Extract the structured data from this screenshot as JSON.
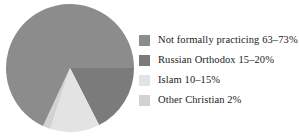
{
  "chart_data": {
    "type": "pie",
    "title": "",
    "subtitle": "",
    "xlabel": "",
    "ylabel": "",
    "legend_position": "right",
    "grid": false,
    "categories": [
      "Not formally practicing",
      "Russian Orthodox",
      "Islam",
      "Other Christian"
    ],
    "labels": [
      "Not formally practicing 63–73%",
      "Russian Orthodox 15–20%",
      "Islam 10–15%",
      "Other Christian 2%"
    ],
    "value_text": [
      "63–73%",
      "15–20%",
      "10–15%",
      "2%"
    ],
    "values": [
      68,
      17.5,
      12.5,
      2
    ],
    "ranges": [
      {
        "min": 63,
        "max": 73
      },
      {
        "min": 15,
        "max": 20
      },
      {
        "min": 10,
        "max": 15
      },
      {
        "min": 2,
        "max": 2
      }
    ],
    "colors": [
      "#8c8c8c",
      "#7b7b7b",
      "#e3e3e3",
      "#d2d2d2"
    ],
    "start_angle_deg": 0,
    "direction": "clockwise",
    "units": "percent"
  },
  "legend": {
    "items": [
      {
        "label": "Not formally practicing 63–73%",
        "swatch": "#8c8c8c",
        "swatch_name": "swatch-not-formally-practicing"
      },
      {
        "label": "Russian Orthodox 15–20%",
        "swatch": "#7b7b7b",
        "swatch_name": "swatch-russian-orthodox"
      },
      {
        "label": "Islam 10–15%",
        "swatch": "#e3e3e3",
        "swatch_name": "swatch-islam"
      },
      {
        "label": "Other Christian 2%",
        "swatch": "#d2d2d2",
        "swatch_name": "swatch-other-christian"
      }
    ]
  },
  "pie": {
    "center_x": 65,
    "center_y": 65,
    "radius": 64,
    "slices": [
      {
        "name": "slice-russian-orthodox",
        "color": "#7b7b7b",
        "start_deg": 0,
        "end_deg": 63
      },
      {
        "name": "slice-islam",
        "color": "#e3e3e3",
        "start_deg": 63,
        "end_deg": 108
      },
      {
        "name": "slice-other-christian",
        "color": "#d2d2d2",
        "start_deg": 108,
        "end_deg": 115
      },
      {
        "name": "slice-not-formally-practicing",
        "color": "#8c8c8c",
        "start_deg": 115,
        "end_deg": 360
      }
    ]
  }
}
